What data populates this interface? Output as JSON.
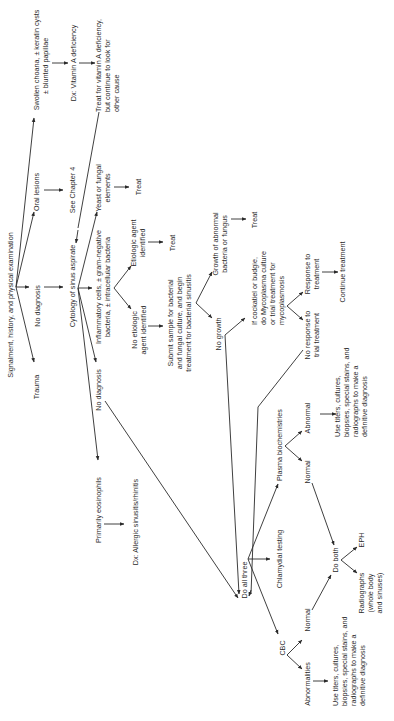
{
  "diagram": {
    "orientation": "rotated-90-ccw",
    "nodes": {
      "root": "Signalment, history, and physical examination",
      "trauma": "Trauma",
      "no_diagnosis_1": "No diagnosis",
      "oral_lesions": "Oral lesions",
      "see_chapter": "See Chapter 4",
      "swollen_choana_1": "Swollen choana, ± keratin cysts",
      "swollen_choana_2": "± blunted papillae",
      "dx_vit_a": "Dx: Vitamin A deficiency",
      "treat_vit_a_1": "Treat for vitamin A deficiency,",
      "treat_vit_a_2": "but continue to look for",
      "treat_vit_a_3": "other cause",
      "cytology": "Cytology of sinus aspirate",
      "yeast_1": "Yeast or fungal",
      "yeast_2": "elements",
      "treat_yeast": "Treat",
      "inflam_1": "Inflammatory cells, ± gram-negative",
      "inflam_2": "bacteria, ± intracellular bacteria",
      "etiologic_1": "Etiologic agent",
      "etiologic_2": "identified",
      "treat_etiologic": "Treat",
      "no_etiologic_1": "No etiologic",
      "no_etiologic_2": "agent identified",
      "submit_1": "Submit sample for bacterial",
      "submit_2": "and fungal culture, and begin",
      "submit_3": "treatment for bacterial sinusitis",
      "growth_1": "Growth of abnormal",
      "growth_2": "bacteria or fungus",
      "treat_growth": "Treat",
      "no_growth": "No growth",
      "cockatiel_1": "If cockatiel or budgie,",
      "cockatiel_2": "do Mycoplasma culture",
      "cockatiel_3": "or trial treatment for",
      "cockatiel_4": "mycoplasmosis",
      "response_1": "Response to",
      "response_2": "treatment",
      "continue_treatment": "Continue treatment",
      "no_response_1": "No response to",
      "no_response_2": "trial treatment",
      "no_diagnosis_2": "No diagnosis",
      "eosinophils": "Primarily eosinophils",
      "dx_allergic": "Dx: Allergic sinusitis/rhinitis",
      "do_all_three": "Do all three",
      "plasma_biochem": "Plasma biochemistries",
      "plasma_normal": "Normal",
      "plasma_abnormal": "Abnormal",
      "use_titers_a_1": "Use titers, cultures,",
      "use_titers_a_2": "biopsies, special stains, and",
      "use_titers_a_3": "radiographs to make a",
      "use_titers_a_4": "definitive diagnosis",
      "chlamydial": "Chlamydial testing",
      "cbc": "CBC",
      "cbc_normal": "Normal",
      "cbc_abnormalities": "Abnormalities",
      "use_titers_b_1": "Use titers, cultures,",
      "use_titers_b_2": "biopsies, special stains, and",
      "use_titers_b_3": "radiographs to make a",
      "use_titers_b_4": "definitive diagnosis",
      "do_both": "Do both",
      "eph": "EPH",
      "radiographs_1": "Radiographs",
      "radiographs_2": "(whole body",
      "radiographs_3": "and sinuses)"
    },
    "colors": {
      "ink": "#2a2a2a",
      "background": "#ffffff"
    }
  }
}
